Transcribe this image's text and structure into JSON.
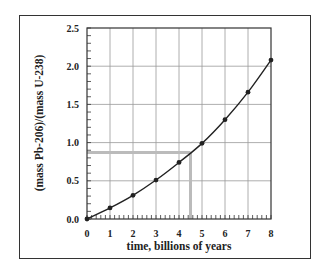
{
  "chart_data": {
    "type": "line",
    "title": "",
    "xlabel": "time, billions of years",
    "ylabel": "(mass Pb-206)/(mass U-238)",
    "xlim": [
      0,
      8
    ],
    "ylim": [
      0,
      2.5
    ],
    "x_ticks": [
      "0",
      "1",
      "2",
      "3",
      "4",
      "5",
      "6",
      "7",
      "8"
    ],
    "y_ticks": [
      "0.0",
      "0.5",
      "1.0",
      "1.5",
      "2.0",
      "2.5"
    ],
    "x_minor_per_major": 5,
    "y_minor_per_major": 5,
    "grid": true,
    "legend": null,
    "series": [
      {
        "name": "Pb-206/U-238 mass ratio",
        "x": [
          0,
          1,
          2,
          3,
          4,
          5,
          6,
          7,
          8
        ],
        "values": [
          0.0,
          0.145,
          0.31,
          0.51,
          0.74,
          0.99,
          1.3,
          1.66,
          2.08
        ],
        "color": "#222222",
        "markers": true
      }
    ],
    "annotations": [
      {
        "type": "reference-line",
        "orientation": "horizontal",
        "y": 0.87,
        "from_x": 0,
        "to_x": 4.5,
        "color": "#bbbbbb"
      },
      {
        "type": "reference-line",
        "orientation": "vertical",
        "x": 4.5,
        "from_y": 0,
        "to_y": 0.87,
        "color": "#bbbbbb"
      }
    ]
  }
}
